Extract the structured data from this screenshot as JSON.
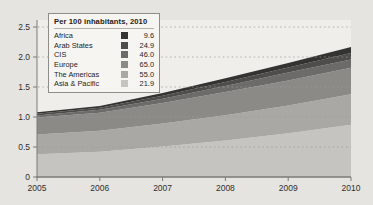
{
  "chart_data": {
    "type": "area",
    "stacked": true,
    "x": [
      2005,
      2006,
      2007,
      2008,
      2009,
      2010
    ],
    "xtick_labels": [
      "2005",
      "2006",
      "2007",
      "2008",
      "2009",
      "2010"
    ],
    "ytick_labels": [
      "0",
      "0.5",
      "1.0",
      "1.5",
      "2.0",
      "2.5"
    ],
    "yticks": [
      0,
      0.5,
      1.0,
      1.5,
      2.0,
      2.5
    ],
    "ylim": [
      0,
      2.5
    ],
    "grid": "dashed-horizontal",
    "legend": {
      "title": "Per 100 inhabitants, 2010",
      "position": "top-left"
    },
    "stack_order_bottom_to_top": [
      "Asia & Pacific",
      "The Americas",
      "Europe",
      "CIS",
      "Arab States",
      "Africa"
    ],
    "series": [
      {
        "name": "Africa",
        "value_label": "9.6",
        "color": "#333331",
        "values": [
          0.025,
          0.03,
          0.045,
          0.06,
          0.075,
          0.1
        ]
      },
      {
        "name": "Arab States",
        "value_label": "24.9",
        "color": "#4e4d4b",
        "values": [
          0.03,
          0.035,
          0.05,
          0.07,
          0.085,
          0.105
        ]
      },
      {
        "name": "CIS",
        "value_label": "46.0",
        "color": "#6c6b69",
        "values": [
          0.035,
          0.05,
          0.07,
          0.1,
          0.13,
          0.14
        ]
      },
      {
        "name": "Europe",
        "value_label": "65.0",
        "color": "#8b8a87",
        "values": [
          0.28,
          0.3,
          0.345,
          0.385,
          0.42,
          0.44
        ]
      },
      {
        "name": "The Americas",
        "value_label": "55.0",
        "color": "#a9a8a5",
        "values": [
          0.33,
          0.35,
          0.38,
          0.42,
          0.46,
          0.51
        ]
      },
      {
        "name": "Asia & Pacific",
        "value_label": "21.9",
        "color": "#c5c4c1",
        "values": [
          0.38,
          0.42,
          0.51,
          0.61,
          0.73,
          0.87
        ]
      }
    ],
    "colors": {
      "page_bg": "#e6e4e0",
      "plot_bg": "#efeeea",
      "grid": "#9f9d99",
      "axis": "#7d7b77",
      "text": "#2f2f2d"
    }
  }
}
